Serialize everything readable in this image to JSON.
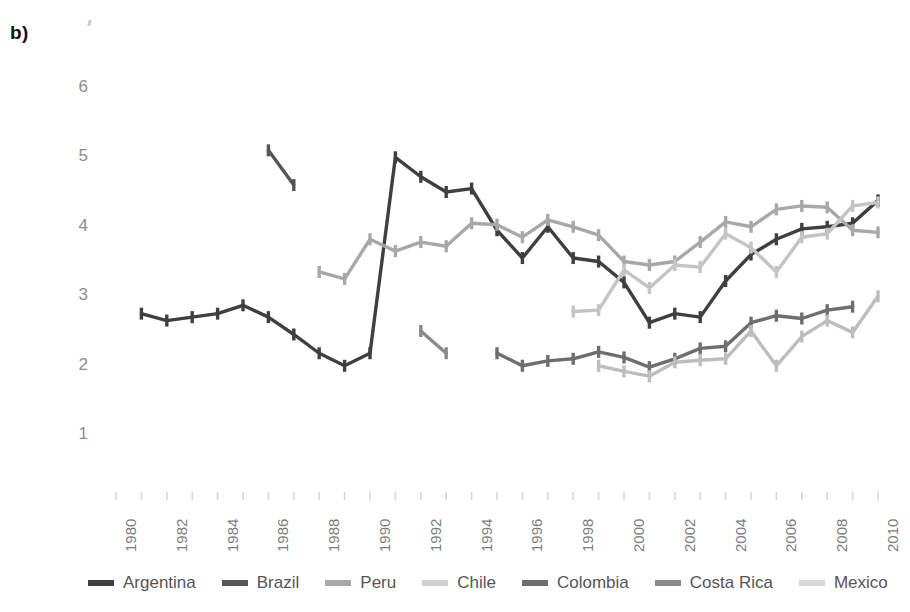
{
  "figure": {
    "panel_label": "b)",
    "background_color": "#ffffff"
  },
  "chart_data": {
    "type": "line",
    "title": "",
    "xlabel": "",
    "ylabel": "",
    "xlim": [
      1980,
      2010
    ],
    "ylim": [
      0.5,
      6.4
    ],
    "yticks": [
      1,
      2,
      3,
      4,
      5,
      6
    ],
    "ytick_labels": [
      "1",
      "2",
      "3",
      "4",
      "5",
      "6"
    ],
    "xticks": [
      1980,
      1982,
      1984,
      1986,
      1988,
      1990,
      1992,
      1994,
      1996,
      1998,
      2000,
      2002,
      2004,
      2006,
      2008,
      2010
    ],
    "xtick_labels": [
      "1980",
      "1982",
      "1984",
      "1986",
      "1988",
      "1990",
      "1992",
      "1994",
      "1996",
      "1998",
      "2000",
      "2002",
      "2004",
      "2006",
      "2008",
      "2010"
    ],
    "grid": false,
    "legend_position": "bottom",
    "markers": "vertical-tick",
    "series": [
      {
        "name": "Argentina",
        "color": "#3f3f3f",
        "x": [
          1981,
          1982,
          1983,
          1984,
          1985,
          1986,
          1987,
          1988,
          1989,
          1990,
          1991,
          1992,
          1993,
          1994,
          1995,
          1996,
          1997,
          1998,
          1999,
          2000,
          2001,
          2002,
          2003,
          2004,
          2005,
          2006,
          2007,
          2008,
          2009,
          2010
        ],
        "values": [
          2.75,
          2.65,
          2.7,
          2.75,
          2.87,
          2.7,
          2.45,
          2.18,
          2.0,
          2.18,
          5.0,
          4.72,
          4.5,
          4.55,
          3.95,
          3.55,
          4.0,
          3.55,
          3.5,
          3.2,
          2.62,
          2.75,
          2.7,
          3.22,
          3.6,
          3.82,
          3.97,
          4.0,
          4.05,
          4.38
        ]
      },
      {
        "name": "Brazil",
        "color": "#555555",
        "x": [
          1986,
          1987
        ],
        "values": [
          5.1,
          4.6
        ]
      },
      {
        "name": "Peru",
        "color": "#a8a8a8",
        "x": [
          1988,
          1989,
          1990,
          1991,
          1992,
          1993,
          1994,
          1995,
          1996,
          1997,
          1998,
          1999,
          2000,
          2001,
          2002,
          2003,
          2004,
          2005,
          2006,
          2007,
          2008,
          2009,
          2010
        ],
        "values": [
          3.35,
          3.25,
          3.82,
          3.65,
          3.78,
          3.72,
          4.05,
          4.03,
          3.85,
          4.1,
          4.0,
          3.88,
          3.5,
          3.45,
          3.5,
          3.78,
          4.07,
          4.0,
          4.25,
          4.3,
          4.28,
          3.95,
          3.92
        ]
      },
      {
        "name": "Chile",
        "color": "#c4c4c4",
        "x": [
          1998,
          1999,
          2000,
          2001,
          2002,
          2003,
          2004,
          2005,
          2006,
          2007,
          2008,
          2009,
          2010
        ],
        "values": [
          2.78,
          2.8,
          3.38,
          3.12,
          3.45,
          3.42,
          3.9,
          3.7,
          3.35,
          3.85,
          3.9,
          4.3,
          4.35
        ]
      },
      {
        "name": "Colombia",
        "color": "#6e6e6e",
        "x": [
          1995,
          1996,
          1997,
          1998,
          1999,
          2000,
          2001,
          2002,
          2003,
          2004,
          2005,
          2006,
          2007,
          2008,
          2009
        ],
        "values": [
          2.18,
          2.0,
          2.07,
          2.1,
          2.2,
          2.12,
          1.98,
          2.1,
          2.25,
          2.28,
          2.62,
          2.72,
          2.68,
          2.8,
          2.85
        ]
      },
      {
        "name": "Costa Rica",
        "color": "#8a8a8a",
        "x": [
          1992,
          1993
        ],
        "values": [
          2.5,
          2.18
        ]
      },
      {
        "name": "Mexico",
        "color": "#bdbdbd",
        "x": [
          1999,
          2000,
          2001,
          2002,
          2003,
          2004,
          2005,
          2006,
          2007,
          2008,
          2009,
          2010
        ],
        "values": [
          2.0,
          1.92,
          1.85,
          2.05,
          2.08,
          2.1,
          2.5,
          2.0,
          2.42,
          2.65,
          2.48,
          3.0
        ]
      }
    ]
  },
  "legend": {
    "items": [
      {
        "label": "Argentina",
        "color": "#3f3f3f"
      },
      {
        "label": "Brazil",
        "color": "#555555"
      },
      {
        "label": "Peru",
        "color": "#a8a8a8"
      },
      {
        "label": "Chile",
        "color": "#cfcfcf"
      },
      {
        "label": "Colombia",
        "color": "#6e6e6e"
      },
      {
        "label": "Costa Rica",
        "color": "#8a8a8a"
      },
      {
        "label": "Mexico",
        "color": "#d8d8d8"
      }
    ]
  }
}
